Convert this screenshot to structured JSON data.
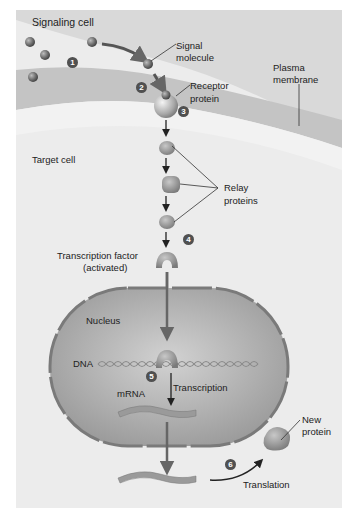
{
  "diagram": {
    "colors": {
      "background_panel": "#ebebeb",
      "extracellular": "#d8d8d8",
      "membrane_band": "#cfcfcf",
      "cytoplasm": "#f0f0f0",
      "nucleus_fill": "#b8b8b8",
      "nucleus_envelope": "#7a7a7a",
      "molecule": "#6e6e6e",
      "protein": "#9a9a9a",
      "step_badge": "#505050",
      "arrow": "#222222"
    },
    "labels": {
      "signaling_cell": "Signaling cell",
      "signal_molecule_1": "Signal",
      "signal_molecule_2": "molecule",
      "plasma_membrane_1": "Plasma",
      "plasma_membrane_2": "membrane",
      "receptor_protein_1": "Receptor",
      "receptor_protein_2": "protein",
      "target_cell": "Target cell",
      "relay_proteins_1": "Relay",
      "relay_proteins_2": "proteins",
      "transcription_factor_1": "Transcription factor",
      "transcription_factor_2": "(activated)",
      "nucleus": "Nucleus",
      "dna": "DNA",
      "mrna": "mRNA",
      "transcription": "Transcription",
      "new_protein_1": "New",
      "new_protein_2": "protein",
      "translation": "Translation"
    },
    "steps": [
      "1",
      "2",
      "3",
      "4",
      "5",
      "6"
    ]
  }
}
